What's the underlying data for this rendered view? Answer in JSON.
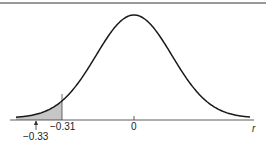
{
  "chart_data": {
    "type": "area",
    "title": "",
    "xlabel": "r",
    "ylabel": "",
    "x_ticks": [
      {
        "value": -0.31,
        "label": "−0.31"
      },
      {
        "value": 0,
        "label": "0"
      }
    ],
    "annotations": [
      {
        "value": -0.33,
        "label": "−0.33",
        "marker": "arrow-up"
      }
    ],
    "shaded_region": {
      "from": "left-tail",
      "to": -0.31,
      "color": "#c8c8c8"
    },
    "mean": 0,
    "curve_color": "#1a1a1a",
    "grid": false,
    "legend": null
  },
  "labels": {
    "tick_neg031": "−0.31",
    "tick_zero": "0",
    "annot_neg033": "−0.33",
    "axis_r": "r"
  }
}
